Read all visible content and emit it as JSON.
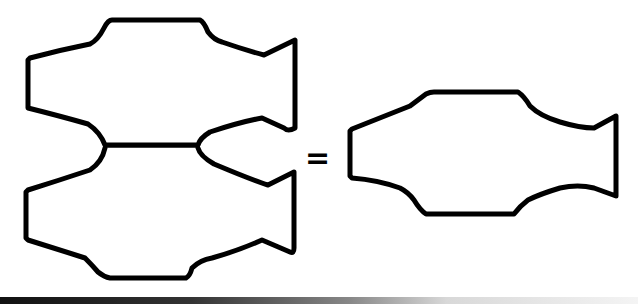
{
  "diagram": {
    "left_group": {
      "shapes": [
        "fish-outline-top",
        "fish-outline-bottom"
      ],
      "connector": "horizontal-line"
    },
    "operator": "=",
    "right_shape": "fish-outline",
    "colors": {
      "stroke": "#000000",
      "background": "#ffffff"
    }
  }
}
